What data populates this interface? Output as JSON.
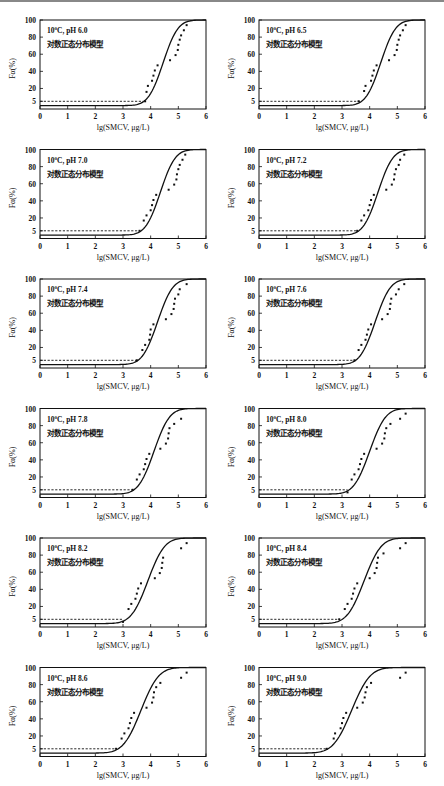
{
  "figure": {
    "caption": ""
  },
  "axes_common": {
    "xlabel": "lg(SMCV,  μg/L)",
    "ylabel": "Fα(%)",
    "xticks": [
      "0",
      "1",
      "2",
      "3",
      "4",
      "5",
      "6"
    ],
    "yticks": [
      "5",
      "20",
      "40",
      "60",
      "80",
      "100"
    ],
    "model_label": "对数正态分布模型",
    "reference_line_y": 5
  },
  "chart_data": [
    {
      "type": "scatter",
      "title": "10°C, pH 6.0",
      "xlabel": "lg(SMCV,  μg/L)",
      "ylabel": "Fα(%)",
      "xlim": [
        0,
        6
      ],
      "ylim": [
        0,
        100
      ],
      "legend_position": "upper-left",
      "fit": {
        "type": "lognormal-cdf",
        "mu": 4.45,
        "sigma": 0.42
      },
      "hc5_x": 3.75,
      "points": [
        [
          3.8,
          5
        ],
        [
          3.85,
          16
        ],
        [
          3.9,
          23
        ],
        [
          4.05,
          29
        ],
        [
          4.1,
          35
        ],
        [
          4.15,
          41
        ],
        [
          4.25,
          47
        ],
        [
          4.7,
          53
        ],
        [
          4.9,
          59
        ],
        [
          4.98,
          65
        ],
        [
          5.0,
          71
        ],
        [
          5.05,
          77
        ],
        [
          5.1,
          82
        ],
        [
          5.2,
          88
        ],
        [
          5.3,
          94
        ]
      ]
    },
    {
      "type": "scatter",
      "title": "10°C, pH 6.5",
      "xlabel": "lg(SMCV,  μg/L)",
      "ylabel": "Fα(%)",
      "xlim": [
        0,
        6
      ],
      "ylim": [
        0,
        100
      ],
      "legend_position": "upper-left",
      "fit": {
        "type": "lognormal-cdf",
        "mu": 4.4,
        "sigma": 0.42
      },
      "hc5_x": 3.7,
      "points": [
        [
          3.6,
          5
        ],
        [
          3.8,
          17
        ],
        [
          3.85,
          23
        ],
        [
          4.05,
          29
        ],
        [
          4.1,
          35
        ],
        [
          4.15,
          41
        ],
        [
          4.25,
          47
        ],
        [
          4.7,
          53
        ],
        [
          4.9,
          59
        ],
        [
          4.98,
          65
        ],
        [
          5.0,
          71
        ],
        [
          5.05,
          77
        ],
        [
          5.1,
          82
        ],
        [
          5.2,
          88
        ],
        [
          5.3,
          94
        ]
      ]
    },
    {
      "type": "scatter",
      "title": "10°C, pH 7.0",
      "xlabel": "lg(SMCV,  μg/L)",
      "ylabel": "Fα(%)",
      "xlim": [
        0,
        6
      ],
      "ylim": [
        0,
        100
      ],
      "legend_position": "upper-left",
      "fit": {
        "type": "lognormal-cdf",
        "mu": 4.35,
        "sigma": 0.42
      },
      "hc5_x": 3.6,
      "points": [
        [
          3.6,
          5
        ],
        [
          3.75,
          17
        ],
        [
          3.85,
          23
        ],
        [
          4.0,
          29
        ],
        [
          4.05,
          35
        ],
        [
          4.1,
          41
        ],
        [
          4.2,
          47
        ],
        [
          4.65,
          53
        ],
        [
          4.85,
          59
        ],
        [
          4.93,
          65
        ],
        [
          4.95,
          71
        ],
        [
          5.0,
          77
        ],
        [
          5.05,
          82
        ],
        [
          5.15,
          88
        ],
        [
          5.25,
          94
        ]
      ]
    },
    {
      "type": "scatter",
      "title": "10°C, pH 7.2",
      "xlabel": "lg(SMCV,  μg/L)",
      "ylabel": "Fα(%)",
      "xlim": [
        0,
        6
      ],
      "ylim": [
        0,
        100
      ],
      "legend_position": "upper-left",
      "fit": {
        "type": "lognormal-cdf",
        "mu": 4.3,
        "sigma": 0.42
      },
      "hc5_x": 3.55,
      "points": [
        [
          3.55,
          5
        ],
        [
          3.7,
          17
        ],
        [
          3.8,
          23
        ],
        [
          3.95,
          29
        ],
        [
          4.0,
          35
        ],
        [
          4.05,
          41
        ],
        [
          4.15,
          47
        ],
        [
          4.6,
          53
        ],
        [
          4.8,
          59
        ],
        [
          4.88,
          65
        ],
        [
          4.9,
          71
        ],
        [
          4.95,
          77
        ],
        [
          5.05,
          82
        ],
        [
          5.1,
          88
        ],
        [
          5.25,
          94
        ]
      ]
    },
    {
      "type": "scatter",
      "title": "10°C, pH 7.4",
      "xlabel": "lg(SMCV,  μg/L)",
      "ylabel": "Fα(%)",
      "xlim": [
        0,
        6
      ],
      "ylim": [
        0,
        100
      ],
      "legend_position": "upper-left",
      "fit": {
        "type": "lognormal-cdf",
        "mu": 4.25,
        "sigma": 0.43
      },
      "hc5_x": 3.5,
      "points": [
        [
          3.5,
          5
        ],
        [
          3.7,
          17
        ],
        [
          3.8,
          23
        ],
        [
          3.95,
          29
        ],
        [
          3.98,
          35
        ],
        [
          4.0,
          41
        ],
        [
          4.1,
          47
        ],
        [
          4.55,
          53
        ],
        [
          4.75,
          59
        ],
        [
          4.83,
          65
        ],
        [
          4.85,
          71
        ],
        [
          4.88,
          77
        ],
        [
          5.0,
          82
        ],
        [
          5.05,
          88
        ],
        [
          5.3,
          94
        ]
      ]
    },
    {
      "type": "scatter",
      "title": "10°C, pH 7.6",
      "xlabel": "lg(SMCV,  μg/L)",
      "ylabel": "Fα(%)",
      "xlim": [
        0,
        6
      ],
      "ylim": [
        0,
        100
      ],
      "legend_position": "upper-left",
      "fit": {
        "type": "lognormal-cdf",
        "mu": 4.2,
        "sigma": 0.43
      },
      "hc5_x": 3.45,
      "points": [
        [
          3.45,
          5
        ],
        [
          3.6,
          17
        ],
        [
          3.7,
          23
        ],
        [
          3.85,
          29
        ],
        [
          3.9,
          35
        ],
        [
          3.95,
          41
        ],
        [
          4.05,
          47
        ],
        [
          4.45,
          53
        ],
        [
          4.65,
          59
        ],
        [
          4.73,
          65
        ],
        [
          4.75,
          71
        ],
        [
          4.78,
          77
        ],
        [
          4.95,
          82
        ],
        [
          5.05,
          88
        ],
        [
          5.25,
          94
        ]
      ]
    },
    {
      "type": "scatter",
      "title": "10°C, pH 7.8",
      "xlabel": "lg(SMCV,  μg/L)",
      "ylabel": "Fα(%)",
      "xlim": [
        0,
        6
      ],
      "ylim": [
        0,
        100
      ],
      "legend_position": "upper-left",
      "fit": {
        "type": "lognormal-cdf",
        "mu": 4.12,
        "sigma": 0.44
      },
      "hc5_x": 3.35,
      "points": [
        [
          3.35,
          5
        ],
        [
          3.5,
          17
        ],
        [
          3.6,
          23
        ],
        [
          3.75,
          29
        ],
        [
          3.8,
          35
        ],
        [
          3.85,
          41
        ],
        [
          3.95,
          47
        ],
        [
          4.35,
          53
        ],
        [
          4.55,
          59
        ],
        [
          4.63,
          65
        ],
        [
          4.65,
          71
        ],
        [
          4.68,
          77
        ],
        [
          4.85,
          82
        ],
        [
          5.1,
          88
        ]
      ]
    },
    {
      "type": "scatter",
      "title": "10°C, pH 8.0",
      "xlabel": "lg(SMCV,  μg/L)",
      "ylabel": "Fα(%)",
      "xlim": [
        0,
        6
      ],
      "ylim": [
        0,
        100
      ],
      "legend_position": "upper-left",
      "fit": {
        "type": "lognormal-cdf",
        "mu": 4.0,
        "sigma": 0.45
      },
      "hc5_x": 3.2,
      "points": [
        [
          3.2,
          2
        ],
        [
          3.35,
          17
        ],
        [
          3.45,
          23
        ],
        [
          3.6,
          29
        ],
        [
          3.65,
          35
        ],
        [
          3.7,
          41
        ],
        [
          3.8,
          47
        ],
        [
          4.25,
          53
        ],
        [
          4.45,
          59
        ],
        [
          4.53,
          65
        ],
        [
          4.55,
          71
        ],
        [
          4.6,
          77
        ],
        [
          4.75,
          82
        ],
        [
          5.1,
          88
        ],
        [
          5.3,
          94
        ]
      ]
    },
    {
      "type": "scatter",
      "title": "10°C, pH 8.2",
      "xlabel": "lg(SMCV,  μg/L)",
      "ylabel": "Fα(%)",
      "xlim": [
        0,
        6
      ],
      "ylim": [
        0,
        100
      ],
      "legend_position": "upper-left",
      "fit": {
        "type": "lognormal-cdf",
        "mu": 3.9,
        "sigma": 0.47
      },
      "hc5_x": 3.0,
      "points": [
        [
          3.0,
          2
        ],
        [
          3.2,
          17
        ],
        [
          3.3,
          23
        ],
        [
          3.45,
          29
        ],
        [
          3.5,
          35
        ],
        [
          3.55,
          41
        ],
        [
          3.65,
          47
        ],
        [
          4.15,
          53
        ],
        [
          4.33,
          59
        ],
        [
          4.4,
          65
        ],
        [
          4.42,
          71
        ],
        [
          4.45,
          77
        ],
        [
          5.1,
          88
        ],
        [
          5.3,
          94
        ]
      ]
    },
    {
      "type": "scatter",
      "title": "10°C, pH 8.4",
      "xlabel": "lg(SMCV,  μg/L)",
      "ylabel": "Fα(%)",
      "xlim": [
        0,
        6
      ],
      "ylim": [
        0,
        100
      ],
      "legend_position": "upper-left",
      "fit": {
        "type": "lognormal-cdf",
        "mu": 3.8,
        "sigma": 0.48
      },
      "hc5_x": 2.9,
      "points": [
        [
          2.9,
          5
        ],
        [
          3.1,
          17
        ],
        [
          3.2,
          23
        ],
        [
          3.35,
          29
        ],
        [
          3.4,
          35
        ],
        [
          3.45,
          41
        ],
        [
          3.55,
          47
        ],
        [
          4.0,
          53
        ],
        [
          4.18,
          59
        ],
        [
          4.25,
          65
        ],
        [
          4.27,
          71
        ],
        [
          4.3,
          77
        ],
        [
          4.5,
          82
        ],
        [
          5.1,
          88
        ],
        [
          5.3,
          94
        ]
      ]
    },
    {
      "type": "scatter",
      "title": "10°C, pH 8.6",
      "xlabel": "lg(SMCV,  μg/L)",
      "ylabel": "Fα(%)",
      "xlim": [
        0,
        6
      ],
      "ylim": [
        0,
        100
      ],
      "legend_position": "upper-left",
      "fit": {
        "type": "lognormal-cdf",
        "mu": 3.65,
        "sigma": 0.5
      },
      "hc5_x": 2.75,
      "points": [
        [
          2.75,
          5
        ],
        [
          2.95,
          17
        ],
        [
          3.05,
          23
        ],
        [
          3.2,
          29
        ],
        [
          3.25,
          35
        ],
        [
          3.3,
          41
        ],
        [
          3.4,
          47
        ],
        [
          3.85,
          53
        ],
        [
          4.05,
          59
        ],
        [
          4.1,
          65
        ],
        [
          4.12,
          71
        ],
        [
          4.2,
          77
        ],
        [
          4.35,
          82
        ],
        [
          5.1,
          88
        ],
        [
          5.3,
          94
        ]
      ]
    },
    {
      "type": "scatter",
      "title": "10°C, pH 9.0",
      "xlabel": "lg(SMCV,  μg/L)",
      "ylabel": "Fα(%)",
      "xlim": [
        0,
        6
      ],
      "ylim": [
        0,
        100
      ],
      "legend_position": "upper-left",
      "fit": {
        "type": "lognormal-cdf",
        "mu": 3.35,
        "sigma": 0.52
      },
      "hc5_x": 2.45,
      "points": [
        [
          2.45,
          5
        ],
        [
          2.7,
          17
        ],
        [
          2.75,
          23
        ],
        [
          2.95,
          29
        ],
        [
          3.0,
          35
        ],
        [
          3.05,
          41
        ],
        [
          3.15,
          47
        ],
        [
          3.55,
          53
        ],
        [
          3.75,
          59
        ],
        [
          3.82,
          65
        ],
        [
          3.85,
          71
        ],
        [
          3.9,
          77
        ],
        [
          4.05,
          82
        ],
        [
          5.1,
          88
        ],
        [
          5.3,
          94
        ]
      ]
    }
  ]
}
